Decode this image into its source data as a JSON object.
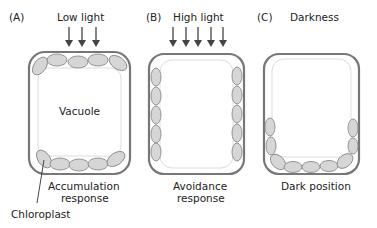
{
  "panels": [
    {
      "id": "A",
      "letter": "(A)",
      "condition": "Low light",
      "arrow_count": 3,
      "response_line1": "Accumulation",
      "response_line2": "response",
      "inner_label": "Vacuole"
    },
    {
      "id": "B",
      "letter": "(B)",
      "condition": "High light",
      "arrow_count": 5,
      "response_line1": "Avoidance",
      "response_line2": "response"
    },
    {
      "id": "C",
      "letter": "(C)",
      "condition": "Darkness",
      "arrow_count": 0,
      "response_line1": "Dark position"
    }
  ],
  "callout": {
    "label": "Chloroplast"
  },
  "colors": {
    "cell_wall": "#777777",
    "membrane": "#dddddd",
    "chloroplast_fill": "#d6d6d6",
    "chloroplast_stroke": "#8a8a8a",
    "arrow": "#444444",
    "text": "#222222"
  }
}
